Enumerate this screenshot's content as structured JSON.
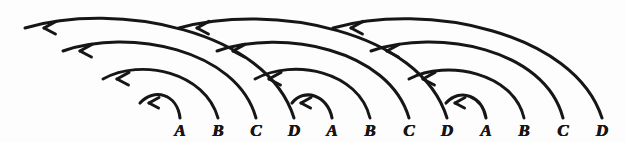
{
  "figure": {
    "ink_color": "#161616",
    "paper_color": "#fdfdfd",
    "style": "hand-drawn pen-and-ink"
  },
  "axis": {
    "baseline_y": 118,
    "first_x": 180,
    "spacing": 38.5,
    "labels": [
      {
        "index": 0,
        "text": "A",
        "x": 180,
        "y": 122
      },
      {
        "index": 1,
        "text": "B",
        "x": 218,
        "y": 122
      },
      {
        "index": 2,
        "text": "C",
        "x": 256,
        "y": 122
      },
      {
        "index": 3,
        "text": "D",
        "x": 294,
        "y": 122
      },
      {
        "index": 4,
        "text": "A",
        "x": 332,
        "y": 122
      },
      {
        "index": 5,
        "text": "B",
        "x": 370,
        "y": 122
      },
      {
        "index": 6,
        "text": "C",
        "x": 409,
        "y": 122
      },
      {
        "index": 7,
        "text": "D",
        "x": 447,
        "y": 122
      },
      {
        "index": 8,
        "text": "A",
        "x": 486,
        "y": 122
      },
      {
        "index": 9,
        "text": "B",
        "x": 524,
        "y": 122
      },
      {
        "index": 10,
        "text": "C",
        "x": 563,
        "y": 122
      },
      {
        "index": 11,
        "text": "D",
        "x": 602,
        "y": 122
      }
    ]
  },
  "chart_data": {
    "type": "diagram",
    "subtype": "arc-diagram",
    "categories": [
      "A",
      "B",
      "C",
      "D",
      "A",
      "B",
      "C",
      "D",
      "A",
      "B",
      "C",
      "D"
    ],
    "direction": "right-to-left",
    "arrowhead": "open-V pointing left",
    "arcs": [
      {
        "id": "a1",
        "from_x": 180,
        "to_x": 140,
        "height": 26,
        "span_steps": 1,
        "arrow_x": 149,
        "arrow_y": 99,
        "label": "A -> D(prev)",
        "tier": 1
      },
      {
        "id": "a2",
        "from_x": 218,
        "to_x": 103,
        "height": 52,
        "span_steps": 3,
        "arrow_x": 117,
        "arrow_y": 73,
        "label": "B -> A(prev)",
        "tier": 2
      },
      {
        "id": "a3",
        "from_x": 256,
        "to_x": 63,
        "height": 78,
        "span_steps": 5,
        "arrow_x": 80,
        "arrow_y": 45,
        "label": "C -> back",
        "tier": 3
      },
      {
        "id": "a4",
        "from_x": 294,
        "to_x": 25,
        "height": 100,
        "span_steps": 7,
        "arrow_x": 44,
        "arrow_y": 22,
        "label": "D -> back",
        "tier": 4
      },
      {
        "id": "b1",
        "from_x": 332,
        "to_x": 292,
        "height": 26,
        "span_steps": 1,
        "arrow_x": 301,
        "arrow_y": 99,
        "label": "A -> D",
        "tier": 1
      },
      {
        "id": "b2",
        "from_x": 370,
        "to_x": 255,
        "height": 52,
        "span_steps": 3,
        "arrow_x": 269,
        "arrow_y": 73,
        "label": "B -> C",
        "tier": 2
      },
      {
        "id": "b3",
        "from_x": 409,
        "to_x": 217,
        "height": 78,
        "span_steps": 5,
        "arrow_x": 233,
        "arrow_y": 45,
        "label": "C -> B",
        "tier": 3
      },
      {
        "id": "b4",
        "from_x": 447,
        "to_x": 179,
        "height": 100,
        "span_steps": 7,
        "arrow_x": 197,
        "arrow_y": 22,
        "label": "D -> A",
        "tier": 4
      },
      {
        "id": "c1",
        "from_x": 486,
        "to_x": 446,
        "height": 26,
        "span_steps": 1,
        "arrow_x": 455,
        "arrow_y": 99,
        "label": "A -> D",
        "tier": 1
      },
      {
        "id": "c2",
        "from_x": 524,
        "to_x": 409,
        "height": 52,
        "span_steps": 3,
        "arrow_x": 423,
        "arrow_y": 73,
        "label": "B -> C",
        "tier": 2
      },
      {
        "id": "c3",
        "from_x": 563,
        "to_x": 371,
        "height": 78,
        "span_steps": 5,
        "arrow_x": 387,
        "arrow_y": 45,
        "label": "C -> B",
        "tier": 3
      },
      {
        "id": "c4",
        "from_x": 602,
        "to_x": 333,
        "height": 100,
        "span_steps": 7,
        "arrow_x": 351,
        "arrow_y": 22,
        "label": "D -> A",
        "tier": 4
      }
    ]
  }
}
